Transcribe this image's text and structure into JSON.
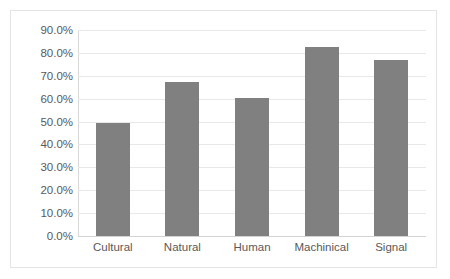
{
  "chart_data": {
    "type": "bar",
    "title": "",
    "subtitle": "",
    "xlabel": "",
    "ylabel": "",
    "categories": [
      "Cultural",
      "Natural",
      "Human",
      "Machinical",
      "Signal"
    ],
    "values": [
      49.3,
      67.3,
      60.3,
      82.5,
      77.0
    ],
    "value_labels": [
      "49.3%",
      "67.3%",
      "60.3%",
      "82.5%",
      "77.0%"
    ],
    "ylim": [
      0,
      90
    ],
    "ytick_values": [
      0,
      10,
      20,
      30,
      40,
      50,
      60,
      70,
      80,
      90
    ],
    "ytick_labels": [
      "0.0%",
      "10.0%",
      "20.0%",
      "30.0%",
      "40.0%",
      "50.0%",
      "60.0%",
      "70.0%",
      "80.0%",
      "90.0%"
    ],
    "grid": true,
    "grid_axis": "y",
    "legend": false,
    "legend_position": "none",
    "series": [
      {
        "name": "",
        "values": [
          49.3,
          67.3,
          60.3,
          82.5,
          77.0
        ]
      }
    ],
    "annotations": []
  },
  "style": {
    "bar_color": "#808080",
    "gridline_color": "#e8e8e8",
    "axis_color": "#d9d9d9",
    "border_color": "#e4e4e4",
    "tick_text_color": "#595959",
    "background": "#ffffff"
  }
}
